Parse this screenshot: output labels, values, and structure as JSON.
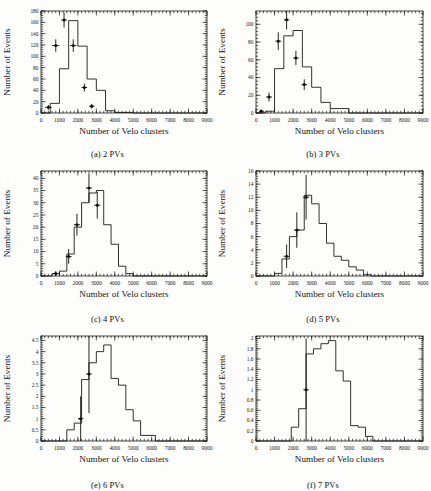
{
  "figure": {
    "axis_labels": {
      "x": "Number of Velo clusters",
      "y": "Number of Events"
    }
  },
  "chart_data": [
    {
      "id": "a",
      "type": "bar",
      "title": "(a) 2 PVs",
      "caption": "(a) 2 PVs",
      "xlabel": "Number of Velo clusters",
      "ylabel": "Number of Events",
      "xlim": [
        0,
        9000
      ],
      "ylim": [
        0,
        180
      ],
      "xticks": [
        0,
        1000,
        2000,
        3000,
        4000,
        5000,
        6000,
        7000,
        8000,
        9000
      ],
      "yticks": [
        0,
        20,
        40,
        60,
        80,
        100,
        120,
        140,
        160,
        180
      ],
      "grid": false,
      "legend": "none",
      "bin_width": 500,
      "bin_edges": [
        0,
        500,
        1000,
        1500,
        2000,
        2500,
        3000,
        3500,
        4000,
        4500,
        5000,
        5500,
        6000
      ],
      "values": [
        0,
        17,
        78,
        163,
        118,
        60,
        40,
        4,
        1,
        1,
        0,
        0
      ],
      "points": [
        {
          "x": 400,
          "y": 10,
          "xerr": 180,
          "yerr": 4
        },
        {
          "x": 800,
          "y": 119,
          "xerr": 200,
          "yerr": 11
        },
        {
          "x": 1250,
          "y": 164,
          "xerr": 150,
          "yerr": 13
        },
        {
          "x": 1750,
          "y": 119,
          "xerr": 170,
          "yerr": 11
        },
        {
          "x": 2350,
          "y": 45,
          "xerr": 150,
          "yerr": 7
        },
        {
          "x": 2750,
          "y": 12,
          "xerr": 150,
          "yerr": 4
        }
      ]
    },
    {
      "id": "b",
      "type": "bar",
      "title": "(b) 3 PVs",
      "caption": "(b) 3 PVs",
      "xlabel": "Number of Velo clusters",
      "ylabel": "Number of Events",
      "xlim": [
        0,
        9000
      ],
      "ylim": [
        0,
        115
      ],
      "xticks": [
        0,
        1000,
        2000,
        3000,
        4000,
        5000,
        6000,
        7000,
        8000,
        9000
      ],
      "yticks": [
        0,
        20,
        40,
        60,
        80,
        100
      ],
      "grid": false,
      "legend": "none",
      "bin_width": 500,
      "bin_edges": [
        0,
        500,
        1000,
        1500,
        2000,
        2500,
        3000,
        3500,
        4000,
        4500,
        5000
      ],
      "values": [
        0,
        2,
        50,
        87,
        93,
        52,
        29,
        12,
        5,
        5
      ],
      "points": [
        {
          "x": 280,
          "y": 2,
          "xerr": 120,
          "yerr": 2
        },
        {
          "x": 700,
          "y": 18,
          "xerr": 160,
          "yerr": 5
        },
        {
          "x": 1200,
          "y": 81,
          "xerr": 160,
          "yerr": 10
        },
        {
          "x": 1650,
          "y": 105,
          "xerr": 150,
          "yerr": 11
        },
        {
          "x": 2150,
          "y": 62,
          "xerr": 150,
          "yerr": 8
        },
        {
          "x": 2600,
          "y": 32,
          "xerr": 150,
          "yerr": 6
        }
      ]
    },
    {
      "id": "c",
      "type": "bar",
      "title": "(c) 4 PVs",
      "caption": "(c) 4 PVs",
      "xlabel": "Number of Velo clusters",
      "ylabel": "Number of Events",
      "xlim": [
        0,
        9000
      ],
      "ylim": [
        0,
        43
      ],
      "xticks": [
        0,
        1000,
        2000,
        3000,
        4000,
        5000,
        6000,
        7000,
        8000,
        9000
      ],
      "yticks": [
        0,
        5,
        10,
        15,
        20,
        25,
        30,
        35,
        40
      ],
      "grid": false,
      "legend": "none",
      "bin_width": 400,
      "bin_edges": [
        600,
        1000,
        1400,
        1800,
        2200,
        2600,
        3000,
        3400,
        3800,
        4200,
        4600,
        5000,
        5400
      ],
      "values": [
        1,
        2,
        9,
        20,
        30,
        34,
        35,
        21,
        13,
        4,
        1,
        0
      ],
      "points": [
        {
          "x": 800,
          "y": 1,
          "xerr": 140,
          "yerr": 1
        },
        {
          "x": 1500,
          "y": 8,
          "xerr": 160,
          "yerr": 3
        },
        {
          "x": 1950,
          "y": 21,
          "xerr": 160,
          "yerr": 4.5
        },
        {
          "x": 2600,
          "y": 36,
          "xerr": 170,
          "yerr": 6
        },
        {
          "x": 3050,
          "y": 29,
          "xerr": 170,
          "yerr": 5.5
        }
      ]
    },
    {
      "id": "d",
      "type": "bar",
      "title": "(d) 5 PVs",
      "caption": "(d) 5 PVs",
      "xlabel": "Number of Velo clusters",
      "ylabel": "Number of Events",
      "xlim": [
        0,
        9000
      ],
      "ylim": [
        0,
        16
      ],
      "xticks": [
        0,
        1000,
        2000,
        3000,
        4000,
        5000,
        6000,
        7000,
        8000,
        9000
      ],
      "yticks": [
        0,
        2,
        4,
        6,
        8,
        10,
        12,
        14,
        16
      ],
      "grid": false,
      "legend": "none",
      "bin_width": 400,
      "bin_edges": [
        1000,
        1400,
        1800,
        2200,
        2600,
        3000,
        3400,
        3800,
        4200,
        4600,
        5000,
        5400,
        5800,
        6200
      ],
      "values": [
        0.4,
        2.6,
        6,
        7,
        12.3,
        11,
        8,
        5,
        3,
        2.4,
        1.4,
        0.9,
        0.2
      ],
      "points": [
        {
          "x": 1650,
          "y": 3,
          "xerr": 150,
          "yerr": 1.8
        },
        {
          "x": 2200,
          "y": 7,
          "xerr": 160,
          "yerr": 2.7
        },
        {
          "x": 2700,
          "y": 12,
          "xerr": 160,
          "yerr": 3.4
        }
      ]
    },
    {
      "id": "e",
      "type": "bar",
      "title": "(e) 6 PVs",
      "caption": "(e) 6 PVs",
      "xlabel": "Number of Velo clusters",
      "ylabel": "Number of Events",
      "xlim": [
        0,
        9000
      ],
      "ylim": [
        0,
        4.7
      ],
      "xticks": [
        0,
        1000,
        2000,
        3000,
        4000,
        5000,
        6000,
        7000,
        8000,
        9000
      ],
      "yticks": [
        0,
        0.5,
        1,
        1.5,
        2,
        2.5,
        3,
        3.5,
        4,
        4.5
      ],
      "ytick_labels": [
        "0",
        "0.5",
        "1",
        "1.5",
        "2",
        "2.5",
        "3",
        "3.5",
        "4",
        "4.5"
      ],
      "grid": false,
      "legend": "none",
      "bin_width": 400,
      "bin_edges": [
        1400,
        1800,
        2200,
        2600,
        3000,
        3400,
        3800,
        4200,
        4600,
        5000,
        5400,
        5800,
        6200
      ],
      "values": [
        0.5,
        0.8,
        2.75,
        3.5,
        4.0,
        4.3,
        2.8,
        2.5,
        1.4,
        0.9,
        0.25,
        0.25
      ],
      "points": [
        {
          "x": 2150,
          "y": 1.0,
          "xerr": 150,
          "yerr": 1.0
        },
        {
          "x": 2600,
          "y": 3.0,
          "xerr": 150,
          "yerr": 1.75
        }
      ]
    },
    {
      "id": "f",
      "type": "bar",
      "title": "(f) 7 PVs",
      "caption": "(f) 7 PVs",
      "xlabel": "Number of Velo clusters",
      "ylabel": "Number of Events",
      "xlim": [
        0,
        9000
      ],
      "ylim": [
        0,
        2.05
      ],
      "xticks": [
        0,
        1000,
        2000,
        3000,
        4000,
        5000,
        6000,
        7000,
        8000,
        9000
      ],
      "yticks": [
        0,
        0.2,
        0.4,
        0.6,
        0.8,
        1,
        1.2,
        1.4,
        1.6,
        1.8,
        2
      ],
      "ytick_labels": [
        "0",
        "0.2",
        "0.4",
        "0.6",
        "0.8",
        "1",
        "1.2",
        "1.4",
        "1.6",
        "1.8",
        "2"
      ],
      "grid": false,
      "legend": "none",
      "bin_width": 400,
      "bin_edges": [
        1900,
        2300,
        2700,
        3100,
        3500,
        3900,
        4300,
        4700,
        5100,
        5500,
        5900,
        6300,
        6700
      ],
      "values": [
        0.27,
        0.63,
        1.7,
        1.8,
        1.9,
        1.96,
        1.37,
        1.17,
        0.3,
        0.27,
        0.09,
        0.0
      ],
      "points": [
        {
          "x": 2700,
          "y": 1.0,
          "xerr": 150,
          "yerr": 1.0
        }
      ]
    }
  ]
}
